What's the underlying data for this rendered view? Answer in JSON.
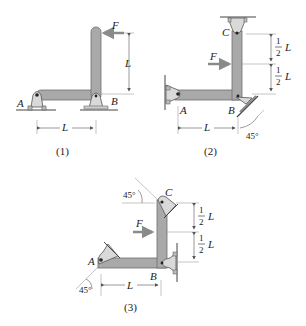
{
  "colors": {
    "member_fill": "#a9a9a9",
    "member_stroke": "#6e6e6e",
    "support_fill": "#d9d9d9",
    "support_stroke": "#555555",
    "ground": "#444444",
    "dim_line": "#555555",
    "force_arrow": "#8a8a8a",
    "text": "#222222"
  },
  "figures": [
    {
      "caption": "(1)",
      "labels": {
        "A": "A",
        "B": "B",
        "force": "F",
        "vertical_dim": "L",
        "horizontal_dim": "L"
      }
    },
    {
      "caption": "(2)",
      "labels": {
        "A": "A",
        "B": "B",
        "C": "C",
        "force": "F",
        "upper_dim_num": "1",
        "upper_dim_den": "2",
        "upper_dim_var": "L",
        "lower_dim_num": "1",
        "lower_dim_den": "2",
        "lower_dim_var": "L",
        "horizontal_dim": "L",
        "angle": "45°"
      }
    },
    {
      "caption": "(3)",
      "labels": {
        "A": "A",
        "B": "B",
        "C": "C",
        "force": "F",
        "upper_dim_num": "1",
        "upper_dim_den": "2",
        "upper_dim_var": "L",
        "lower_dim_num": "1",
        "lower_dim_den": "2",
        "lower_dim_var": "L",
        "horizontal_dim": "L",
        "angle_top": "45°",
        "angle_bottom": "45°"
      }
    }
  ]
}
